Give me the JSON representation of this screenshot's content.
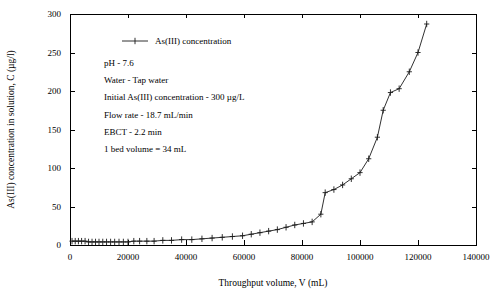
{
  "chart_data": {
    "type": "line",
    "title": "",
    "xlabel": "Throughput volume, V (mL)",
    "ylabel": "As(III) concentration in solution, C (µg/l)",
    "xlim": [
      0,
      140000
    ],
    "ylim": [
      0,
      300
    ],
    "xticks": [
      0,
      20000,
      40000,
      60000,
      80000,
      100000,
      120000,
      140000
    ],
    "xticklabels": [
      "0",
      "20000",
      "40000",
      "60000",
      "80000",
      "100000",
      "120000",
      "140000"
    ],
    "yticks": [
      0,
      50,
      100,
      150,
      200,
      250,
      300
    ],
    "yticklabels": [
      "0",
      "50",
      "100",
      "150",
      "200",
      "250",
      "300"
    ],
    "grid": false,
    "legend_position": "upper-left-inside",
    "series": [
      {
        "name": "As(III) concentration",
        "marker": "plus",
        "color": "#1a1a1a",
        "x": [
          700,
          1800,
          2900,
          4000,
          5200,
          6400,
          7600,
          8800,
          10000,
          11300,
          12600,
          14000,
          15400,
          16900,
          18400,
          20000,
          22000,
          24000,
          26500,
          29000,
          32000,
          35000,
          38500,
          42000,
          45500,
          49000,
          52500,
          56000,
          59500,
          62500,
          65500,
          68500,
          71500,
          74500,
          77500,
          80500,
          83500,
          86500,
          88000,
          91000,
          94000,
          97000,
          100000,
          103000,
          106000,
          108000,
          110500,
          113500,
          117000,
          120000,
          123000
        ],
        "y": [
          5,
          5,
          5,
          5,
          5,
          4,
          4,
          4,
          4,
          4,
          4,
          4,
          4,
          4,
          4,
          4,
          5,
          5,
          5,
          5,
          6,
          6,
          7,
          7,
          8,
          9,
          10,
          11,
          12,
          14,
          16,
          18,
          20,
          23,
          26,
          28,
          30,
          40,
          68,
          72,
          78,
          86,
          94,
          112,
          140,
          175,
          198,
          203,
          225,
          250,
          287
        ]
      }
    ],
    "annotations": [
      "pH - 7.6",
      "Water - Tap water",
      "Initial As(III) concentration - 300 µg/L",
      "Flow rate - 18.7 mL/min",
      "EBCT - 2.2 min",
      "1 bed volume = 34 mL"
    ]
  },
  "legend": {
    "entry_label": "As(III) concentration"
  },
  "colors": {
    "series": "#1a1a1a",
    "axis": "#000000",
    "background": "#ffffff"
  }
}
